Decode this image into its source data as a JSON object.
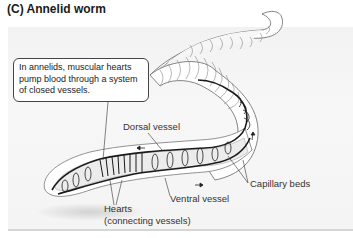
{
  "figure": {
    "title": "(C)  Annelid worm",
    "callout": "In annelids, muscular hearts pump blood through a system of closed vessels.",
    "labels": {
      "dorsal_vessel": "Dorsal vessel",
      "ventral_vessel": "Ventral vessel",
      "capillary_beds": "Capillary beds",
      "hearts_line1": "Hearts",
      "hearts_line2": "(connecting vessels)"
    },
    "colors": {
      "panel_bg": "#f4f4f4",
      "worm_body": "#ffffff",
      "outline": "#555555",
      "vessel": "#1a1a1a"
    }
  }
}
